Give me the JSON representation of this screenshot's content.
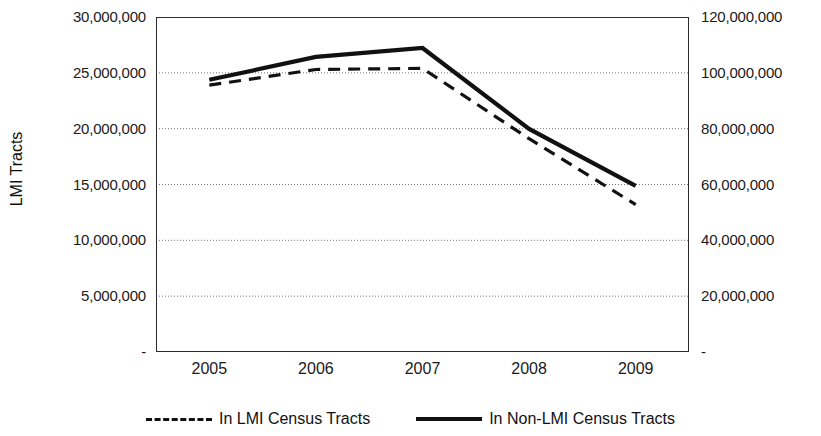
{
  "chart_data": {
    "type": "line",
    "title": "",
    "xlabel": "",
    "ylabel": "LMI Tracts",
    "ylabel_right": "",
    "x": [
      "2005",
      "2006",
      "2007",
      "2008",
      "2009"
    ],
    "categories": [
      "2005",
      "2006",
      "2007",
      "2008",
      "2009"
    ],
    "grid": true,
    "legend_position": "bottom",
    "axes": {
      "left": {
        "label": "LMI Tracts",
        "min": 0,
        "max": 30000000,
        "step": 5000000,
        "ticks": [
          "30,000,000",
          "25,000,000",
          "20,000,000",
          "15,000,000",
          "10,000,000",
          "5,000,000",
          "-"
        ],
        "tick_values": [
          30000000,
          25000000,
          20000000,
          15000000,
          10000000,
          5000000,
          0
        ]
      },
      "right": {
        "label": "",
        "min": 0,
        "max": 120000000,
        "step": 20000000,
        "ticks": [
          "120,000,000",
          "100,000,000",
          "80,000,000",
          "60,000,000",
          "40,000,000",
          "20,000,000",
          "-"
        ],
        "tick_values": [
          120000000,
          100000000,
          80000000,
          60000000,
          40000000,
          20000000,
          0
        ]
      }
    },
    "series": [
      {
        "name": "In LMI Census Tracts",
        "axis": "left",
        "style": "dashed",
        "color": "#111111",
        "values": [
          23900000,
          25300000,
          25400000,
          19100000,
          13200000
        ]
      },
      {
        "name": "In Non-LMI Census Tracts",
        "axis": "right",
        "style": "solid",
        "color": "#111111",
        "values": [
          97500000,
          105700000,
          108900000,
          79900000,
          59500000
        ]
      }
    ]
  },
  "legend": {
    "items": [
      {
        "label": "In LMI Census Tracts",
        "style": "dashed"
      },
      {
        "label": "In Non-LMI Census Tracts",
        "style": "solid"
      }
    ]
  }
}
